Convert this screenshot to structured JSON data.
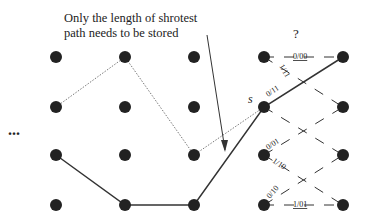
{
  "annotation": {
    "line1": "Only the length of shrotest",
    "line2": "path needs to be stored"
  },
  "ellipsis": "...",
  "question_mark": "?",
  "start_label": "s",
  "trellis_labels": {
    "top": "0/00",
    "diag_top_down": "1/11",
    "s_up": "0/11",
    "row2_up": "0/01",
    "row2_down": "1/10",
    "row3_up": "0/10",
    "bottom": "1/01"
  },
  "colors": {
    "node": "#222222",
    "line": "#333333"
  }
}
